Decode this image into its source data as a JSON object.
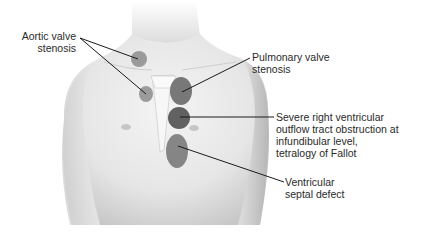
{
  "figure": {
    "type": "anatomical-diagram",
    "colors": {
      "background": "#ffffff",
      "skin_light": "#f0f0f0",
      "skin_shadow": "#b8b8b8",
      "marker_light": "#8c8c8c",
      "marker_dark": "#5e5e5e",
      "leader_line": "#1a1a1a",
      "text": "#2a2a2a"
    }
  },
  "labels": {
    "aortic": {
      "line1": "Aortic valve",
      "line2": "stenosis"
    },
    "pulmonary": {
      "line1": "Pulmonary valve",
      "line2": "stenosis"
    },
    "rvot": {
      "line1": "Severe right ventricular",
      "line2": "outflow tract obstruction at",
      "line3": "infundibular level,",
      "line4": "tetralogy of Fallot"
    },
    "vsd": {
      "line1": "Ventricular",
      "line2": "septal defect"
    }
  },
  "markers": [
    {
      "name": "aortic-upper",
      "cx": 139,
      "cy": 59,
      "rx": 8,
      "ry": 8
    },
    {
      "name": "aortic-lower",
      "cx": 146,
      "cy": 94,
      "rx": 7,
      "ry": 8
    },
    {
      "name": "pulmonary",
      "cx": 181,
      "cy": 91,
      "rx": 11,
      "ry": 14
    },
    {
      "name": "rvot",
      "cx": 179,
      "cy": 118,
      "rx": 11,
      "ry": 11
    },
    {
      "name": "vsd",
      "cx": 177,
      "cy": 151,
      "rx": 11,
      "ry": 17
    }
  ]
}
